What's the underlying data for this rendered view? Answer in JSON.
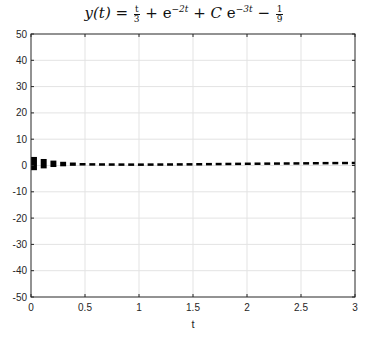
{
  "chart_data": {
    "type": "line",
    "xlabel": "t",
    "ylabel": "",
    "xlim": [
      0,
      3
    ],
    "ylim": [
      -50,
      50
    ],
    "xticks": [
      0,
      0.5,
      1,
      1.5,
      2,
      2.5,
      3
    ],
    "xtick_labels": [
      "0",
      "0.5",
      "1",
      "1.5",
      "2",
      "2.5",
      "3"
    ],
    "yticks": [
      -50,
      -40,
      -30,
      -20,
      -10,
      0,
      10,
      20,
      30,
      40,
      50
    ],
    "ytick_labels": [
      "-50",
      "-40",
      "-30",
      "-20",
      "-10",
      "0",
      "10",
      "20",
      "30",
      "40",
      "50"
    ],
    "grid": true,
    "legend": null,
    "line_style": "dashed",
    "line_color": "#000000",
    "series": [
      {
        "name": "family of solutions (C varies)",
        "x": [
          0,
          0.1,
          0.2,
          0.3,
          0.4,
          0.5,
          0.6,
          0.8,
          1.0,
          1.25,
          1.5,
          1.75,
          2.0,
          2.25,
          2.5,
          2.75,
          3.0
        ],
        "y_upper": [
          3.5,
          2.6,
          1.9,
          1.4,
          1.1,
          0.9,
          0.75,
          0.55,
          0.45,
          0.45,
          0.5,
          0.6,
          0.7,
          0.75,
          0.85,
          0.95,
          1.0
        ],
        "y_lower": [
          -2.0,
          -1.2,
          -0.6,
          -0.3,
          -0.1,
          0.0,
          0.05,
          0.15,
          0.2,
          0.3,
          0.4,
          0.5,
          0.6,
          0.7,
          0.75,
          0.85,
          0.9
        ]
      }
    ]
  },
  "figure": {
    "title_parts": {
      "lhs": "y(t) = ",
      "frac1_num": "t",
      "frac1_den": "3",
      "plus1": " + ",
      "e1": "e",
      "exp1": "−2t",
      "plus2": " + C ",
      "e2": "e",
      "exp2": "−3t",
      "minus": " − ",
      "frac2_num": "1",
      "frac2_den": "9"
    },
    "xlabel": "t"
  }
}
